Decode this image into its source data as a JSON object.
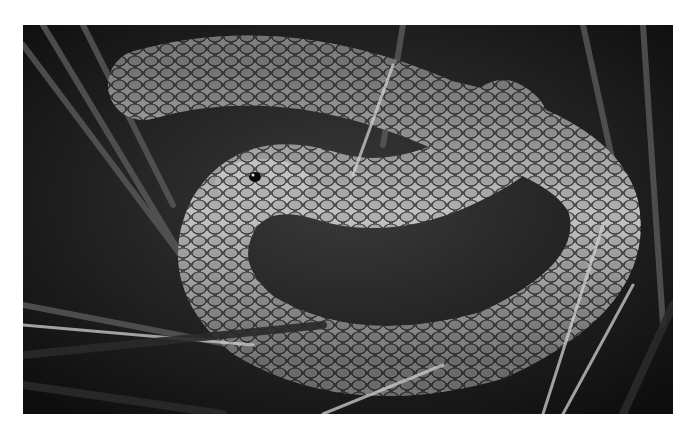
{
  "image": {
    "subject": "snake coiled among grass blades",
    "alt": "Black and white photograph of a coiled snake with keeled scales resting in grass and reeds",
    "palette": {
      "background": "#ffffff",
      "dark": "#141414",
      "mid": "#7a7a7a",
      "light": "#d8d8d8"
    }
  }
}
